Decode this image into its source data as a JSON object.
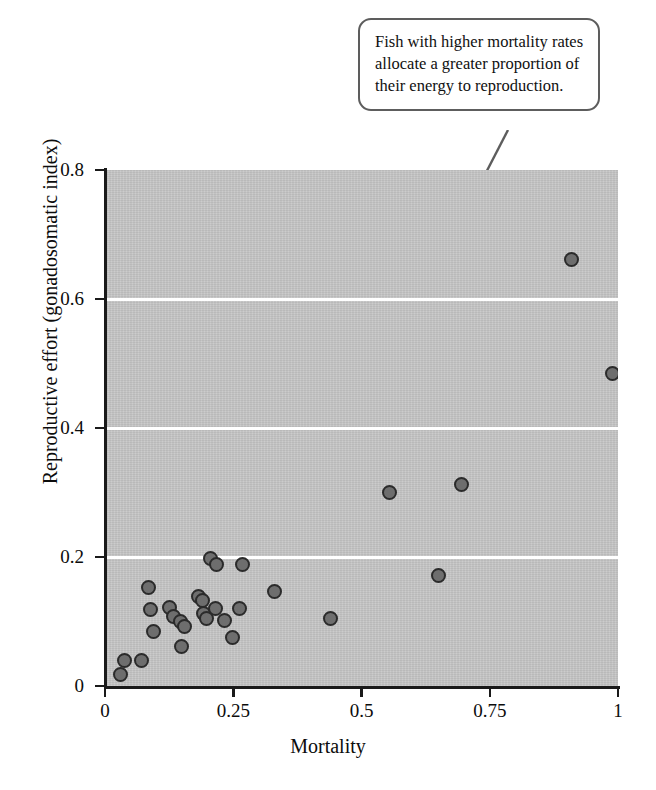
{
  "annotation": {
    "text": "Fish with higher mortality rates allocate a greater proportion of their energy to reproduction.",
    "leader_color": "#5d5d5d",
    "border_color": "#5d5d5d"
  },
  "colors": {
    "plot_background": "#c6c6c6",
    "gridline": "#ffffff",
    "axis": "#1a1a1a",
    "marker_fill": "#6e6e6e",
    "marker_edge": "#2b2b2b"
  },
  "chart_data": {
    "type": "scatter",
    "title": "",
    "xlabel": "Mortality",
    "ylabel": "Reproductive effort (gonadosomatic index)",
    "xlim": [
      0,
      1
    ],
    "ylim": [
      0,
      0.8
    ],
    "xticks": [
      "0",
      "0.25",
      "0.5",
      "0.75",
      "1"
    ],
    "xtick_values": [
      0,
      0.25,
      0.5,
      0.75,
      1
    ],
    "yticks": [
      "0",
      "0.2",
      "0.4",
      "0.6",
      "0.8"
    ],
    "ytick_values": [
      0,
      0.2,
      0.4,
      0.6,
      0.8
    ],
    "grid": "horizontal gridlines in white at y = 0.2, 0.4, 0.6",
    "gridlines_y": [
      0.2,
      0.4,
      0.6
    ],
    "legend": "none",
    "series": [
      {
        "name": "Fish species",
        "points": [
          [
            0.03,
            0.018
          ],
          [
            0.038,
            0.04
          ],
          [
            0.072,
            0.04
          ],
          [
            0.085,
            0.152
          ],
          [
            0.088,
            0.118
          ],
          [
            0.095,
            0.085
          ],
          [
            0.125,
            0.122
          ],
          [
            0.133,
            0.108
          ],
          [
            0.148,
            0.1
          ],
          [
            0.155,
            0.092
          ],
          [
            0.15,
            0.062
          ],
          [
            0.182,
            0.138
          ],
          [
            0.19,
            0.132
          ],
          [
            0.192,
            0.112
          ],
          [
            0.198,
            0.105
          ],
          [
            0.205,
            0.198
          ],
          [
            0.218,
            0.188
          ],
          [
            0.215,
            0.12
          ],
          [
            0.232,
            0.102
          ],
          [
            0.248,
            0.075
          ],
          [
            0.268,
            0.188
          ],
          [
            0.262,
            0.12
          ],
          [
            0.33,
            0.147
          ],
          [
            0.44,
            0.105
          ],
          [
            0.555,
            0.3
          ],
          [
            0.65,
            0.172
          ],
          [
            0.695,
            0.312
          ],
          [
            0.91,
            0.662
          ],
          [
            0.99,
            0.485
          ]
        ]
      }
    ]
  }
}
